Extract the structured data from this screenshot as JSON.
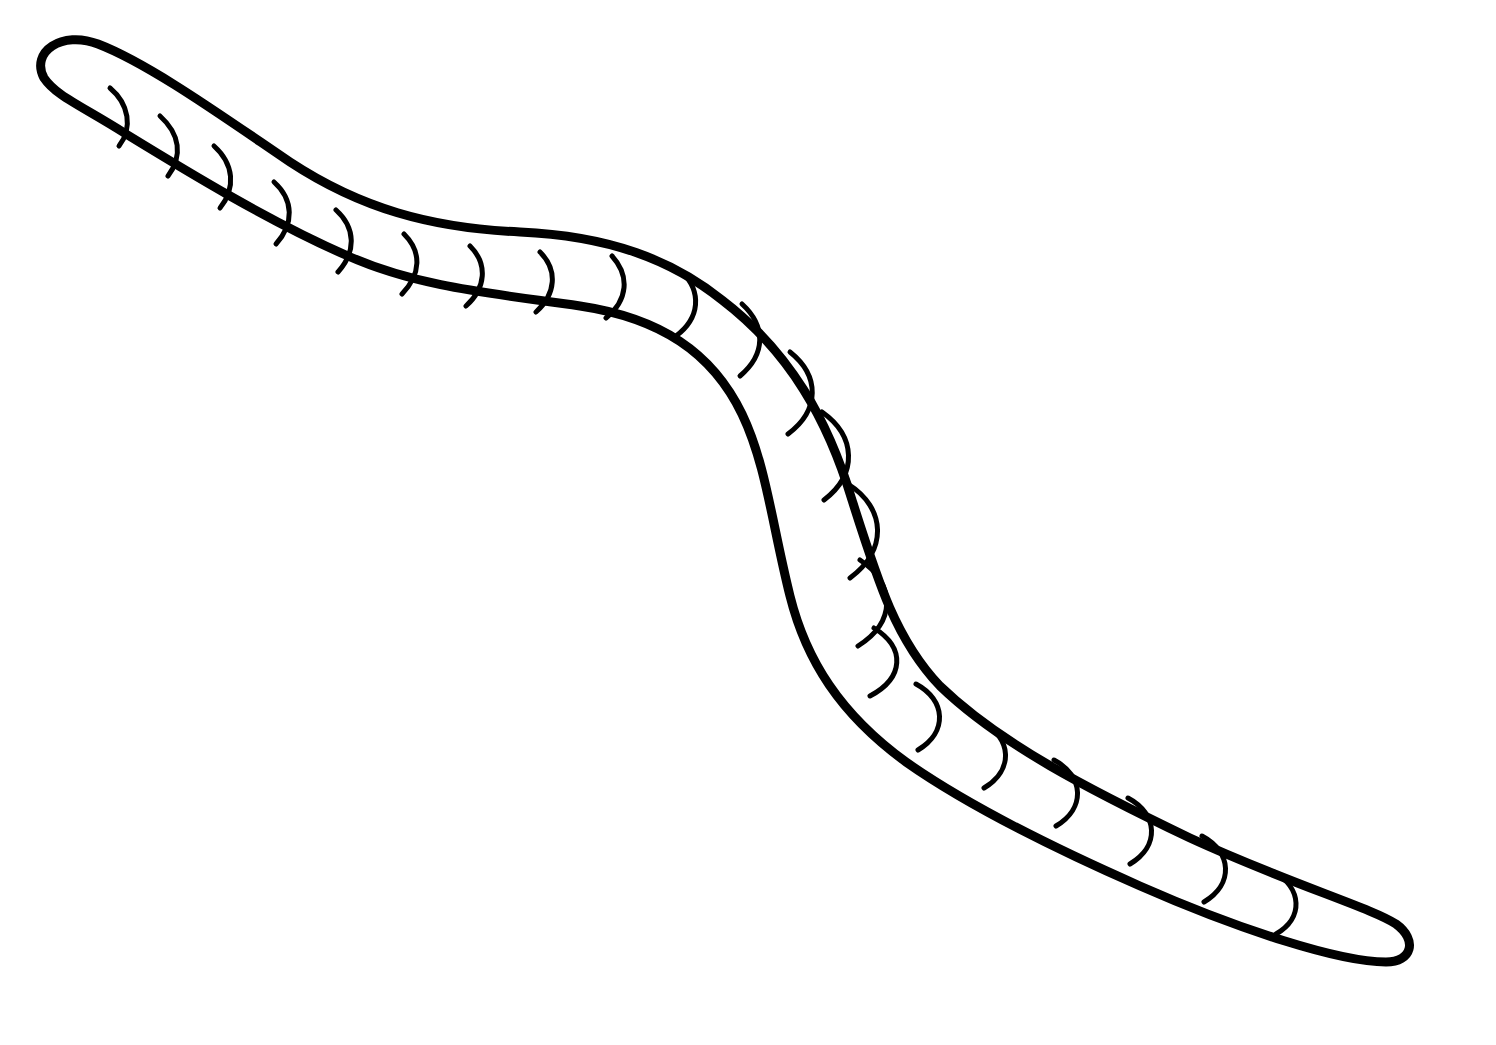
{
  "image": {
    "title": "Earthworm Line Drawing",
    "subject": "earthworm",
    "style": "coloring-book line art",
    "background_color": "#ffffff",
    "ink_color": "#000000",
    "width": 1496,
    "height": 1045,
    "outline_stroke_width": 9,
    "segment_stroke_width": 5,
    "text_content": "",
    "description": "Black outline drawing of an earthworm forming a long S-shaped curve from the upper-left head to the lower-right tail, with short curved ring marks along the body."
  },
  "anatomy": {
    "head_tip": {
      "x": 40,
      "y": 60
    },
    "tail_tip": {
      "x": 1402,
      "y": 941
    },
    "segment_mark_count": 20,
    "body_width_head": 62,
    "body_width_mid": 105,
    "body_width_tail": 58,
    "bend_count": 2,
    "orientation": "upper-left to lower-right"
  },
  "geometry": {
    "body_outline_path": "M 44 78 C 30 52 62 30 98 44 C 150 64 225 118 290 162 C 360 208 430 228 520 232 C 610 236 672 260 722 300 C 790 352 828 420 852 500 C 878 582 896 640 940 686 C 1000 744 1090 790 1190 838 C 1290 884 1372 908 1396 924 C 1418 940 1412 962 1386 962 C 1340 962 1240 930 1140 886 C 1040 842 960 800 906 762 C 840 714 806 660 790 596 C 772 524 766 464 742 414 C 712 352 660 318 580 306 C 498 294 420 288 348 256 C 270 222 188 172 126 134 C 82 106 56 96 44 78 Z",
    "segment_marks": [
      "M 110 88 C 129 104 133 128 119 146",
      "M 160 116 C 180 134 183 156 168 176",
      "M 214 146 C 234 164 236 188 220 208",
      "M 274 182 C 294 200 294 224 276 244",
      "M 336 210 C 356 228 356 252 338 272",
      "M 404 234 C 422 252 421 274 402 294",
      "M 470 246 C 488 264 486 288 466 306",
      "M 540 252 C 558 270 556 294 536 312",
      "M 612 256 C 630 276 628 300 606 318",
      "M 682 272 C 702 292 700 318 676 336",
      "M 742 304 C 766 326 766 354 740 376",
      "M 790 352 C 820 376 820 410 788 434",
      "M 822 412 C 856 436 858 474 824 500",
      "M 848 484 C 886 508 888 550 850 578",
      "M 860 560 C 896 584 896 622 858 646",
      "M 874 628 C 906 648 904 678 870 696",
      "M 916 684 C 946 700 948 732 918 750",
      "M 982 722 C 1012 738 1014 770 984 788",
      "M 1054 760 C 1084 776 1086 808 1056 826",
      "M 1128 798 C 1158 814 1160 846 1130 864",
      "M 1202 836 C 1232 852 1234 884 1204 902",
      "M 1274 872 C 1302 888 1304 918 1276 934"
    ]
  }
}
